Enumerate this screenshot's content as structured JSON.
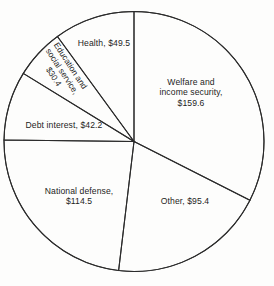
{
  "chart_data": {
    "type": "pie",
    "title": "",
    "subtitle": "",
    "xlabel": "",
    "ylabel": "",
    "units": "billions of dollars",
    "legend_position": "none",
    "grid": false,
    "total": 491.6,
    "categories": [
      "Welfare and income security",
      "Other",
      "National defense",
      "Debt interest",
      "Education and social service",
      "Health"
    ],
    "values": [
      159.6,
      95.4,
      114.5,
      42.2,
      30.4,
      49.5
    ],
    "slices": [
      {
        "name": "Welfare and income security",
        "value": 159.6,
        "value_label": "$159.6",
        "label": "Welfare and\nincome security,\n$159.6",
        "start_angle_deg": 0,
        "end_angle_deg": 116.9,
        "label_x": 145,
        "label_y": 77,
        "label_width": 92,
        "rotation_deg": 0
      },
      {
        "name": "Other",
        "value": 95.4,
        "value_label": "$95.4",
        "label": "Other, $95.4",
        "start_angle_deg": 116.9,
        "end_angle_deg": 186.8,
        "label_x": 143,
        "label_y": 196,
        "label_width": 84,
        "rotation_deg": 0
      },
      {
        "name": "National defense",
        "value": 114.5,
        "value_label": "$114.5",
        "label": "National defense,\n$114.5",
        "start_angle_deg": 186.8,
        "end_angle_deg": 270.7,
        "label_x": 29,
        "label_y": 186,
        "label_width": 100,
        "rotation_deg": 0
      },
      {
        "name": "Debt interest",
        "value": 42.2,
        "value_label": "$42.2",
        "label": "Debt interest, $42.2",
        "start_angle_deg": 270.7,
        "end_angle_deg": 301.6,
        "label_x": 12,
        "label_y": 120,
        "label_width": 104,
        "rotation_deg": 0
      },
      {
        "name": "Education and social service",
        "value": 30.4,
        "value_label": "$30.4",
        "label": "Education and\nsocial service,\n$30.4",
        "start_angle_deg": 301.6,
        "end_angle_deg": 323.9,
        "label_x": 29,
        "label_y": 56,
        "label_width": 66,
        "rotation_deg": 57
      },
      {
        "name": "Health",
        "value": 49.5,
        "value_label": "$49.5",
        "label": "Health, $49.5",
        "start_angle_deg": 323.9,
        "end_angle_deg": 360,
        "label_x": 66,
        "label_y": 38,
        "label_width": 76,
        "rotation_deg": 0
      }
    ],
    "geometry": {
      "center_x": 134,
      "center_y": 141.5,
      "radius": 130
    },
    "colors": {
      "stroke": "#2b2b2b",
      "fill": "none",
      "background": "#fdfdfc",
      "text": "#1d1d1d"
    }
  }
}
